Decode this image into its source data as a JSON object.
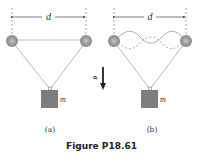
{
  "figure": {
    "caption": "Figure P18.61",
    "panel_a": {
      "label": "(a)",
      "dimension_label": "d",
      "mass_label": "m"
    },
    "panel_b": {
      "label": "(b)",
      "dimension_label": "d",
      "mass_label": "m"
    },
    "gravity_label": "g",
    "colors": {
      "line": "#999999",
      "pulley": "#888888",
      "mass": "#7a7a7a",
      "arrow": "#222222",
      "dashed": "#888888"
    }
  }
}
